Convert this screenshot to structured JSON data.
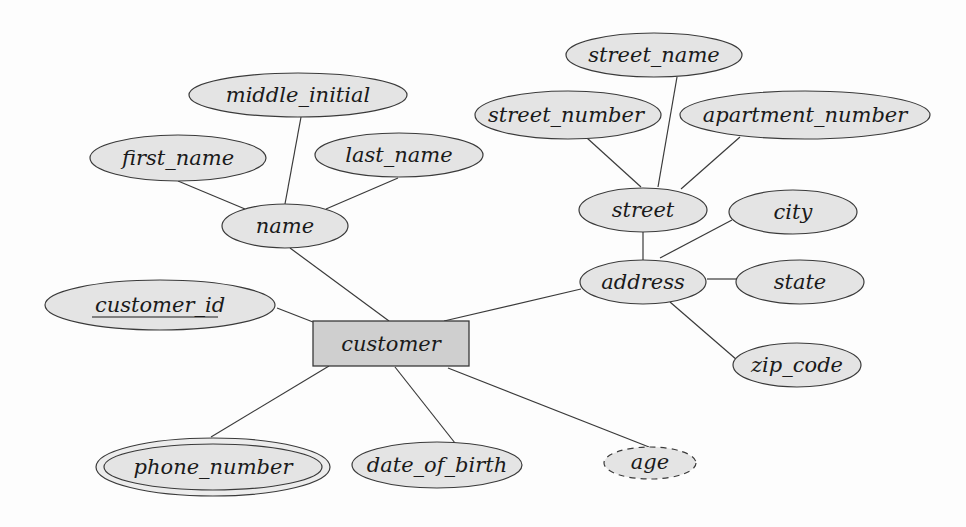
{
  "diagram": {
    "type": "entity-relationship",
    "entity": {
      "id": "customer",
      "label": "customer"
    },
    "attributes": [
      {
        "id": "customer_id",
        "label": "customer_id",
        "kind": "key"
      },
      {
        "id": "name",
        "label": "name",
        "kind": "composite"
      },
      {
        "id": "first_name",
        "label": "first_name",
        "kind": "simple",
        "parent": "name"
      },
      {
        "id": "middle_initial",
        "label": "middle_initial",
        "kind": "simple",
        "parent": "name"
      },
      {
        "id": "last_name",
        "label": "last_name",
        "kind": "simple",
        "parent": "name"
      },
      {
        "id": "address",
        "label": "address",
        "kind": "composite"
      },
      {
        "id": "street",
        "label": "street",
        "kind": "composite",
        "parent": "address"
      },
      {
        "id": "street_number",
        "label": "street_number",
        "kind": "simple",
        "parent": "street"
      },
      {
        "id": "street_name",
        "label": "street_name",
        "kind": "simple",
        "parent": "street"
      },
      {
        "id": "apartment_number",
        "label": "apartment_number",
        "kind": "simple",
        "parent": "street"
      },
      {
        "id": "city",
        "label": "city",
        "kind": "simple",
        "parent": "address"
      },
      {
        "id": "state",
        "label": "state",
        "kind": "simple",
        "parent": "address"
      },
      {
        "id": "zip_code",
        "label": "zip_code",
        "kind": "simple",
        "parent": "address"
      },
      {
        "id": "phone_number",
        "label": "phone_number",
        "kind": "multivalued"
      },
      {
        "id": "date_of_birth",
        "label": "date_of_birth",
        "kind": "simple"
      },
      {
        "id": "age",
        "label": "age",
        "kind": "derived"
      }
    ],
    "labels": {
      "customer": "customer",
      "customer_id": "customer_id",
      "name": "name",
      "first_name": "first_name",
      "middle_initial": "middle_initial",
      "last_name": "last_name",
      "address": "address",
      "street": "street",
      "street_number": "street_number",
      "street_name": "street_name",
      "apartment_number": "apartment_number",
      "city": "city",
      "state": "state",
      "zip_code": "zip_code",
      "phone_number": "phone_number",
      "date_of_birth": "date_of_birth",
      "age": "age"
    },
    "colors": {
      "entity_fill": "#cfcfcf",
      "attribute_fill": "#e4e4e4",
      "stroke": "#3a3a3a"
    }
  }
}
